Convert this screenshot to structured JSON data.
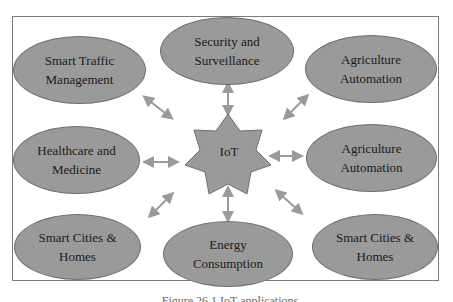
{
  "diagram": {
    "center": {
      "label": "IoT",
      "shape": "seven-point-star"
    },
    "nodes": [
      {
        "id": "smart-traffic",
        "label": "Smart Traffic\nManagement"
      },
      {
        "id": "security",
        "label": "Security and\nSurveillance"
      },
      {
        "id": "agriculture-1",
        "label": "Agriculture\nAutomation"
      },
      {
        "id": "healthcare",
        "label": "Healthcare and\nMedicine"
      },
      {
        "id": "agriculture-2",
        "label": "Agriculture\nAutomation"
      },
      {
        "id": "smart-cities-1",
        "label": "Smart Cities &\nHomes"
      },
      {
        "id": "energy",
        "label": "Energy\nConsumption"
      },
      {
        "id": "smart-cities-2",
        "label": "Smart Cities &\nHomes"
      }
    ],
    "caption": "Figure 26.1 IoT applications",
    "colors": {
      "node_fill": "#9a9a9a",
      "arrow": "#9a9a9a",
      "border": "#7a7a7a"
    }
  }
}
